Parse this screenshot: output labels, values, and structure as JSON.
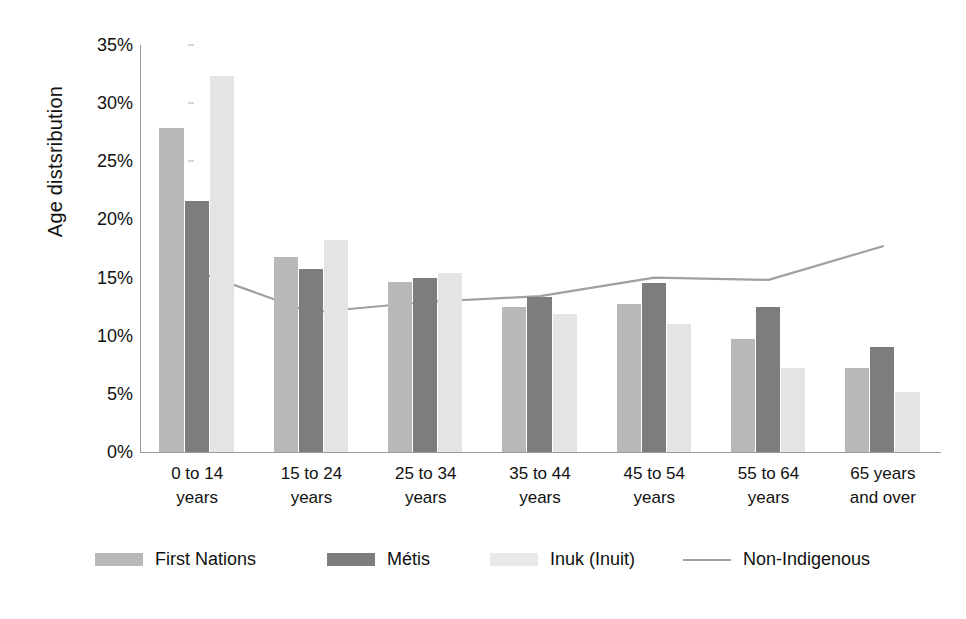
{
  "chart_data": {
    "type": "bar",
    "title": "",
    "xlabel": "",
    "ylabel": "Age distsribution",
    "ylim": [
      0,
      35
    ],
    "ytick_values": [
      35,
      30,
      25,
      20,
      15,
      10,
      5,
      0
    ],
    "ytick_labels": [
      "35%",
      "30%",
      "25%",
      "20%",
      "15%",
      "10%",
      "5%",
      "0%"
    ],
    "grid": false,
    "legend_position": "bottom",
    "categories": [
      "0 to 14 years",
      "15 to 24 years",
      "25 to 34 years",
      "35 to 44 years",
      "45 to 54 years",
      "55 to 64 years",
      "65 years and over"
    ],
    "category_lines": [
      [
        "0 to 14",
        "years"
      ],
      [
        "15 to 24",
        "years"
      ],
      [
        "25 to 34",
        "years"
      ],
      [
        "35 to 44",
        "years"
      ],
      [
        "45 to 54",
        "years"
      ],
      [
        "55 to 64",
        "years"
      ],
      [
        "65 years",
        "and over"
      ]
    ],
    "series": [
      {
        "name": "First Nations",
        "kind": "bar",
        "color": "#b8b8b8",
        "values": [
          27.9,
          16.8,
          14.6,
          12.5,
          12.7,
          9.7,
          7.2
        ]
      },
      {
        "name": "Métis",
        "kind": "bar",
        "color": "#7d7d7d",
        "values": [
          21.6,
          15.7,
          15.0,
          13.3,
          14.5,
          12.5,
          9.0
        ]
      },
      {
        "name": "Inuk (Inuit)",
        "kind": "bar",
        "color": "#e4e4e4",
        "values": [
          32.3,
          18.2,
          15.4,
          11.9,
          11.0,
          7.2,
          5.2
        ]
      },
      {
        "name": "Non-Indigenous",
        "kind": "line",
        "color": "#a0a0a0",
        "values": [
          15.5,
          12.0,
          12.9,
          13.4,
          15.0,
          14.8,
          17.7
        ]
      }
    ]
  },
  "legend": {
    "items": [
      {
        "label": "First Nations",
        "marker": "swatch",
        "color": "#b8b8b8"
      },
      {
        "label": "Métis",
        "marker": "swatch",
        "color": "#7d7d7d"
      },
      {
        "label": "Inuk (Inuit)",
        "marker": "swatch",
        "color": "#e9e9e9"
      },
      {
        "label": "Non-Indigenous",
        "marker": "line",
        "color": "#a0a0a0"
      }
    ]
  }
}
